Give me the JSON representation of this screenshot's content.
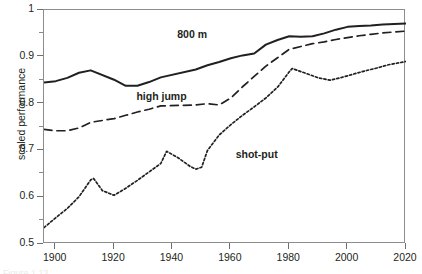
{
  "chart_data": {
    "type": "line",
    "title": "",
    "xlabel": "",
    "ylabel": "scaled performance",
    "xlim": [
      1896,
      2020
    ],
    "ylim": [
      0.5,
      1.0
    ],
    "grid": false,
    "legend_position": "inline-on-curve",
    "x_ticks": [
      1900,
      1920,
      1940,
      1960,
      1980,
      2000,
      2020
    ],
    "x_tick_labels": [
      "1900",
      "1920",
      "1940",
      "1960",
      "1980",
      "2000",
      "2020"
    ],
    "y_ticks": [
      0.5,
      0.6,
      0.7,
      0.8,
      0.9,
      1.0
    ],
    "y_tick_labels": [
      "0.5",
      "0.6",
      "0.7",
      "0.8",
      "0.9",
      "1"
    ],
    "series": [
      {
        "name": "800 m",
        "style": "solid",
        "color": "#231f20",
        "label_x": 1942,
        "label_y": 0.945,
        "points": [
          [
            1896,
            0.845
          ],
          [
            1900,
            0.848
          ],
          [
            1904,
            0.855
          ],
          [
            1908,
            0.866
          ],
          [
            1912,
            0.871
          ],
          [
            1920,
            0.851
          ],
          [
            1924,
            0.838
          ],
          [
            1928,
            0.838
          ],
          [
            1932,
            0.846
          ],
          [
            1936,
            0.856
          ],
          [
            1948,
            0.873
          ],
          [
            1952,
            0.882
          ],
          [
            1956,
            0.889
          ],
          [
            1960,
            0.897
          ],
          [
            1964,
            0.903
          ],
          [
            1968,
            0.907
          ],
          [
            1972,
            0.926
          ],
          [
            1976,
            0.936
          ],
          [
            1980,
            0.944
          ],
          [
            1984,
            0.943
          ],
          [
            1988,
            0.944
          ],
          [
            1992,
            0.95
          ],
          [
            1996,
            0.958
          ],
          [
            2000,
            0.964
          ],
          [
            2004,
            0.966
          ],
          [
            2008,
            0.967
          ],
          [
            2012,
            0.969
          ],
          [
            2016,
            0.97
          ],
          [
            2020,
            0.971
          ]
        ]
      },
      {
        "name": "high jump",
        "style": "dashed",
        "color": "#231f20",
        "label_x": 1928,
        "label_y": 0.812,
        "points": [
          [
            1896,
            0.745
          ],
          [
            1900,
            0.742
          ],
          [
            1904,
            0.742
          ],
          [
            1908,
            0.748
          ],
          [
            1912,
            0.76
          ],
          [
            1920,
            0.768
          ],
          [
            1924,
            0.775
          ],
          [
            1928,
            0.782
          ],
          [
            1932,
            0.788
          ],
          [
            1936,
            0.795
          ],
          [
            1948,
            0.797
          ],
          [
            1952,
            0.8
          ],
          [
            1956,
            0.797
          ],
          [
            1960,
            0.812
          ],
          [
            1964,
            0.836
          ],
          [
            1968,
            0.858
          ],
          [
            1972,
            0.88
          ],
          [
            1976,
            0.898
          ],
          [
            1980,
            0.916
          ],
          [
            1984,
            0.922
          ],
          [
            1988,
            0.928
          ],
          [
            1992,
            0.932
          ],
          [
            1996,
            0.937
          ],
          [
            2000,
            0.941
          ],
          [
            2004,
            0.945
          ],
          [
            2008,
            0.948
          ],
          [
            2012,
            0.951
          ],
          [
            2016,
            0.953
          ],
          [
            2020,
            0.955
          ]
        ]
      },
      {
        "name": "shot-put",
        "style": "dotted",
        "color": "#231f20",
        "label_x": 1962,
        "label_y": 0.688,
        "points": [
          [
            1896,
            0.535
          ],
          [
            1900,
            0.556
          ],
          [
            1904,
            0.576
          ],
          [
            1908,
            0.601
          ],
          [
            1912,
            0.637
          ],
          [
            1913,
            0.64
          ],
          [
            1916,
            0.614
          ],
          [
            1920,
            0.604
          ],
          [
            1924,
            0.619
          ],
          [
            1928,
            0.636
          ],
          [
            1932,
            0.654
          ],
          [
            1936,
            0.672
          ],
          [
            1938,
            0.698
          ],
          [
            1942,
            0.684
          ],
          [
            1946,
            0.666
          ],
          [
            1948,
            0.66
          ],
          [
            1950,
            0.664
          ],
          [
            1952,
            0.7
          ],
          [
            1956,
            0.733
          ],
          [
            1960,
            0.755
          ],
          [
            1964,
            0.775
          ],
          [
            1968,
            0.793
          ],
          [
            1972,
            0.812
          ],
          [
            1976,
            0.835
          ],
          [
            1980,
            0.868
          ],
          [
            1981,
            0.875
          ],
          [
            1986,
            0.864
          ],
          [
            1990,
            0.855
          ],
          [
            1994,
            0.85
          ],
          [
            1998,
            0.856
          ],
          [
            2002,
            0.863
          ],
          [
            2006,
            0.87
          ],
          [
            2010,
            0.876
          ],
          [
            2014,
            0.883
          ],
          [
            2020,
            0.89
          ]
        ]
      }
    ]
  },
  "axes": {
    "y_minor_ticks": [
      0.55,
      0.65,
      0.75,
      0.85,
      0.95
    ]
  },
  "caption_sliver": "Figure 1.12"
}
